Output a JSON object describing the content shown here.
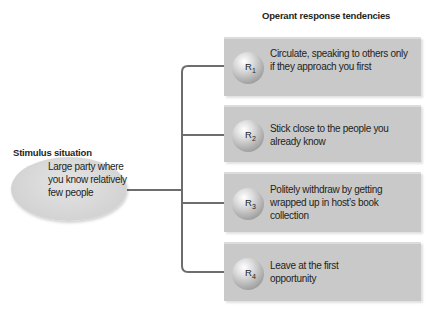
{
  "diagram": {
    "stimulus": {
      "title": "Stimulus situation",
      "text": "Large party where you know relatively few people"
    },
    "responses": {
      "title": "Operant response tendencies",
      "items": [
        {
          "label": "R",
          "sub": "1",
          "text": "Circulate, speaking to others only if they approach you first"
        },
        {
          "label": "R",
          "sub": "2",
          "text": "Stick close to the people you already know"
        },
        {
          "label": "R",
          "sub": "3",
          "text": "Politely withdraw by getting wrapped up in host’s book collection"
        },
        {
          "label": "R",
          "sub": "4",
          "text": "Leave at the first opportunity"
        }
      ]
    },
    "colors": {
      "box": "#c9c9c9",
      "ellipse": "#d3d3d3",
      "line": "#6d6d6d"
    }
  }
}
